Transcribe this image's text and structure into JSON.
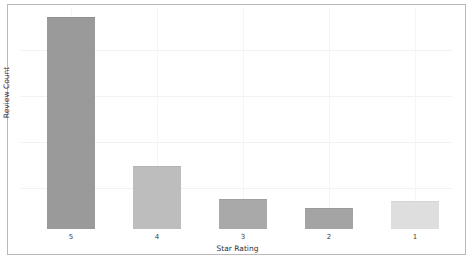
{
  "chart_data": {
    "type": "bar",
    "title": "",
    "subtitle": "",
    "xlabel": "Star Rating",
    "ylabel": "Review Count",
    "categories": [
      "5",
      "4",
      "3",
      "2",
      "1"
    ],
    "values": [
      211,
      62,
      29,
      20,
      27
    ],
    "ylim": [
      0,
      221
    ],
    "grid": true,
    "legend": false,
    "legend_position": "none",
    "bar_colors": [
      "#9a9a9a",
      "#bdbdbd",
      "#a9a9a9",
      "#a4a4a4",
      "#dedede"
    ],
    "bar_edge_colors": [
      "#8f8f8f",
      "#b4b4b4",
      "#a0a0a0",
      "#9b9b9b",
      "#d4d4d4"
    ],
    "axis_tick_labels_y": [],
    "gridline_y_positions": [
      42,
      88,
      134,
      180
    ],
    "background_color": "#ffffff",
    "frame_color": "#b9b9b9",
    "grid_color": "#f2f2f2"
  },
  "ticks": [
    {
      "label": "5"
    },
    {
      "label": "4"
    },
    {
      "label": "3"
    },
    {
      "label": "2"
    },
    {
      "label": "1"
    }
  ]
}
